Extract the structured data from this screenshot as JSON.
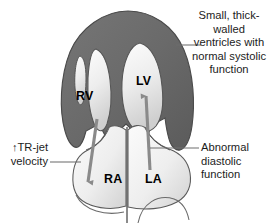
{
  "figure": {
    "background_color": "#ffffff",
    "width": 277,
    "height": 223
  },
  "colors": {
    "myocardium": "#6a6a6a",
    "myocardium_dark": "#5e5e5e",
    "chamber_light": "#f2f2f2",
    "chamber_shade": "#d4d4d4",
    "outline": "#4a4a4a",
    "arrow": "#8a8a8a",
    "leader_line": "#6e6e6e",
    "text": "#1c1c1c",
    "label_text": "#000000"
  },
  "chamber_labels": {
    "rv": "RV",
    "lv": "LV",
    "ra": "RA",
    "la": "LA"
  },
  "annotations": {
    "systolic": {
      "text": "Small, thick-walled\nventricles with\nnormal systolic\nfunction",
      "align": "center"
    },
    "diastolic": {
      "text": "Abnormal\ndiastolic\nfunction",
      "align": "left"
    },
    "tr_jet": {
      "text": "↑TR-jet\nvelocity",
      "align": "right"
    }
  },
  "arrows": [
    {
      "name": "tr-jet-regurgitation-arrow",
      "direction": "down",
      "from_chamber": "RV",
      "to_chamber": "RA"
    },
    {
      "name": "diastolic-filling-arrow",
      "direction": "up",
      "from_chamber": "LA",
      "to_chamber": "LV"
    }
  ],
  "leader_lines": [
    {
      "name": "systolic-leader",
      "x1": 176,
      "y1": 45,
      "x2": 200,
      "y2": 45
    },
    {
      "name": "diastolic-leader",
      "x1": 152,
      "y1": 148,
      "x2": 198,
      "y2": 148
    },
    {
      "name": "tr-jet-leader",
      "x1": 50,
      "y1": 162,
      "x2": 80,
      "y2": 162
    }
  ]
}
